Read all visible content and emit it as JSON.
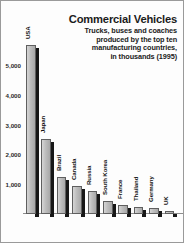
{
  "chart_data": {
    "type": "bar",
    "title": "Commercial Vehicles",
    "subtitle_lines": [
      "Trucks, buses and coaches",
      "produced by the top ten",
      "manufacturing countries,",
      "in thousands (1995)"
    ],
    "xlabel": "",
    "ylabel": "",
    "unit": "thousands",
    "year": "1995",
    "ylim": [
      0,
      6000
    ],
    "grid": false,
    "legend": "none",
    "ytick_labels": [
      "1,000",
      "2,000",
      "3,000",
      "4,000",
      "5,000"
    ],
    "ytick_values": [
      1000,
      2000,
      3000,
      4000,
      5000
    ],
    "categories": [
      "USA",
      "Japan",
      "Brazil",
      "Canada",
      "Russia",
      "South Korea",
      "France",
      "Thailand",
      "Germany",
      "UK"
    ],
    "values": [
      5650,
      2500,
      1230,
      950,
      760,
      420,
      290,
      220,
      200,
      110
    ]
  },
  "colors": {
    "bar_face": "#c2c2c2",
    "bar_shadow": "#171717",
    "bar_outline": "#5f5f5f",
    "text": "#1b1b1b",
    "background": "#fdfdfd",
    "frame_border": "#9a9a9a"
  }
}
